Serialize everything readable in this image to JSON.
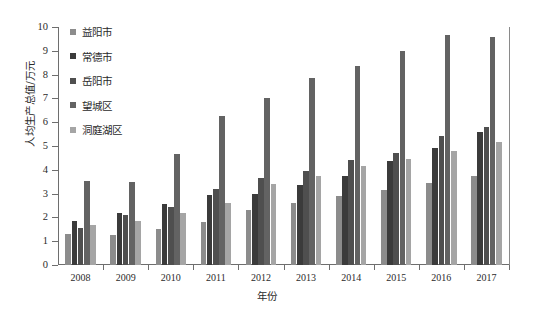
{
  "chart_data": {
    "type": "bar",
    "title": "",
    "xlabel": "年份",
    "ylabel": "人均生产总值/万元",
    "categories": [
      "2008",
      "2009",
      "2010",
      "2011",
      "2012",
      "2013",
      "2014",
      "2015",
      "2016",
      "2017"
    ],
    "ylim": [
      0,
      10
    ],
    "yticks": [
      0,
      1,
      2,
      3,
      4,
      5,
      6,
      7,
      8,
      9,
      10
    ],
    "grid": false,
    "legend_position": "upper-left",
    "series": [
      {
        "name": "益阳市",
        "color": "#8c8c8c",
        "values": [
          1.3,
          1.25,
          1.5,
          1.8,
          2.3,
          2.6,
          2.9,
          3.15,
          3.45,
          3.75
        ]
      },
      {
        "name": "常德市",
        "color": "#3b3b3b",
        "values": [
          1.85,
          2.2,
          2.55,
          2.95,
          3.0,
          3.35,
          3.75,
          4.35,
          4.9,
          5.6
        ]
      },
      {
        "name": "岳阳市",
        "color": "#4f4f4f",
        "values": [
          1.55,
          2.1,
          2.45,
          3.2,
          3.65,
          3.95,
          4.4,
          4.7,
          5.4,
          5.8
        ]
      },
      {
        "name": "望城区",
        "color": "#636363",
        "values": [
          3.55,
          3.5,
          4.65,
          6.25,
          7.0,
          7.85,
          8.35,
          9.0,
          9.65,
          9.6
        ]
      },
      {
        "name": "洞庭湖区",
        "color": "#a5a5a5",
        "values": [
          1.7,
          1.85,
          2.2,
          2.6,
          3.4,
          3.75,
          4.15,
          4.45,
          4.8,
          5.15
        ]
      }
    ]
  }
}
